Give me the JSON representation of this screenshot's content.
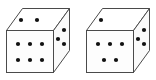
{
  "scene": {
    "title": "Two dice illustration",
    "width": 156,
    "height": 80,
    "background_color": "#ffffff",
    "face_fill": "#fdfdfd",
    "top_face_fill": "#ffffff",
    "side_face_fill": "#fafafa",
    "outline_color": "#4a4a4a",
    "pip_color": "#111111",
    "outline_width": 1,
    "pip_radius": 2.1
  },
  "dice": [
    {
      "id": "left-die",
      "label": "Left die",
      "front_value": 6,
      "top_value": 2,
      "right_value": 3,
      "geometry": {
        "front": {
          "x": 6.5,
          "y": 30.5,
          "w": 47,
          "h": 42
        },
        "top_back_offset_x": 16,
        "top_back_offset_y": 22
      },
      "front_pips": [
        {
          "cx": 18,
          "cy": 44
        },
        {
          "cx": 30,
          "cy": 44
        },
        {
          "cx": 42,
          "cy": 44
        },
        {
          "cx": 18,
          "cy": 60
        },
        {
          "cx": 30,
          "cy": 60
        },
        {
          "cx": 42,
          "cy": 60
        }
      ],
      "top_pips": [
        {
          "cx": 21,
          "cy": 20
        },
        {
          "cx": 37,
          "cy": 20
        }
      ],
      "right_pips": [
        {
          "cx": 64,
          "cy": 30
        },
        {
          "cx": 58,
          "cy": 39
        },
        {
          "cx": 64,
          "cy": 44
        }
      ]
    },
    {
      "id": "right-die",
      "label": "Right die",
      "front_value": 5,
      "top_value": 1,
      "right_value": 3,
      "geometry": {
        "front": {
          "x": 86.5,
          "y": 30.5,
          "w": 47,
          "h": 42
        },
        "top_back_offset_x": 16,
        "top_back_offset_y": 22
      },
      "front_pips": [
        {
          "cx": 98,
          "cy": 44
        },
        {
          "cx": 110,
          "cy": 44
        },
        {
          "cx": 122,
          "cy": 44
        },
        {
          "cx": 104,
          "cy": 60
        },
        {
          "cx": 116,
          "cy": 60
        }
      ],
      "top_pips": [
        {
          "cx": 101,
          "cy": 20
        }
      ],
      "right_pips": [
        {
          "cx": 144,
          "cy": 30
        },
        {
          "cx": 138,
          "cy": 39
        },
        {
          "cx": 144,
          "cy": 44
        }
      ]
    }
  ]
}
